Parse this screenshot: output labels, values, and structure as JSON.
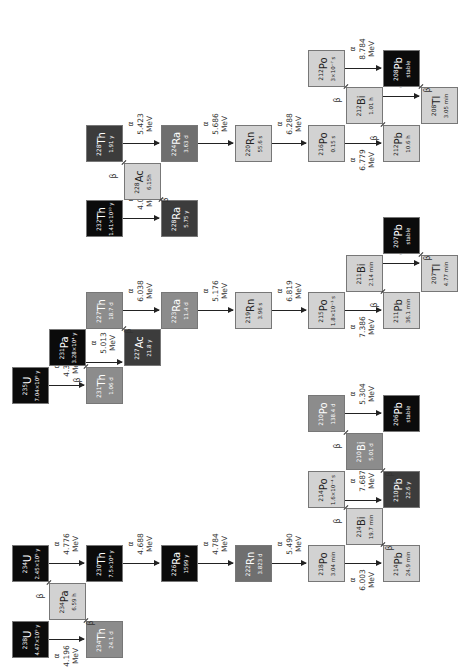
{
  "colors": {
    "black": "#0b0b0b",
    "dark": "#3c3c3c",
    "mid": "#6f6f6f",
    "midlight": "#8c8c8c",
    "light": "#d2d2d2",
    "line": "#222222"
  },
  "labels": {
    "alpha": "α",
    "beta": "β",
    "mev": "MeV"
  },
  "nuclides": [
    {
      "id": "th232",
      "mass": "232",
      "el": "Th",
      "hl": "1.41×10¹⁰ y",
      "x": 86,
      "y": 200,
      "shade": "black"
    },
    {
      "id": "ra228",
      "mass": "228",
      "el": "Ra",
      "hl": "5.75 y",
      "x": 161,
      "y": 200,
      "shade": "dark"
    },
    {
      "id": "ac228",
      "mass": "228",
      "el": "Ac",
      "hl": "6.15h",
      "x": 124,
      "y": 163,
      "shade": "light"
    },
    {
      "id": "th228",
      "mass": "228",
      "el": "Th",
      "hl": "1.91 y",
      "x": 86,
      "y": 125,
      "shade": "dark"
    },
    {
      "id": "ra224",
      "mass": "224",
      "el": "Ra",
      "hl": "3.63 d",
      "x": 161,
      "y": 125,
      "shade": "mid"
    },
    {
      "id": "rn220",
      "mass": "220",
      "el": "Rn",
      "hl": "55.6 s",
      "x": 235,
      "y": 125,
      "shade": "light"
    },
    {
      "id": "po216",
      "mass": "216",
      "el": "Po",
      "hl": "0.15 s",
      "x": 308,
      "y": 125,
      "shade": "light"
    },
    {
      "id": "pb212",
      "mass": "212",
      "el": "Pb",
      "hl": "10.6 h",
      "x": 383,
      "y": 125,
      "shade": "light"
    },
    {
      "id": "bi212",
      "mass": "212",
      "el": "Bi",
      "hl": "1.01 h",
      "x": 346,
      "y": 87,
      "shade": "light"
    },
    {
      "id": "po212",
      "mass": "212",
      "el": "Po",
      "hl": "3×10⁻⁷ s",
      "x": 308,
      "y": 50,
      "shade": "light"
    },
    {
      "id": "pb208",
      "mass": "208",
      "el": "Pb",
      "hl": "stable",
      "x": 383,
      "y": 50,
      "shade": "black"
    },
    {
      "id": "tl208",
      "mass": "208",
      "el": "Tl",
      "hl": "3.05 min",
      "x": 421,
      "y": 87,
      "shade": "light"
    },
    {
      "id": "u235",
      "mass": "235",
      "el": "U",
      "hl": "7.04×10⁸ y",
      "x": 12,
      "y": 367,
      "shade": "black"
    },
    {
      "id": "th231",
      "mass": "231",
      "el": "Th",
      "hl": "1.06 d",
      "x": 86,
      "y": 367,
      "shade": "midlight"
    },
    {
      "id": "pa231",
      "mass": "231",
      "el": "Pa",
      "hl": "3.28×10⁴ y",
      "x": 49,
      "y": 329,
      "shade": "black"
    },
    {
      "id": "ac227",
      "mass": "227",
      "el": "Ac",
      "hl": "21.8 y",
      "x": 124,
      "y": 329,
      "shade": "dark"
    },
    {
      "id": "th227",
      "mass": "227",
      "el": "Th",
      "hl": "18.7 d",
      "x": 86,
      "y": 292,
      "shade": "midlight"
    },
    {
      "id": "ra223",
      "mass": "223",
      "el": "Ra",
      "hl": "11.4 d",
      "x": 161,
      "y": 292,
      "shade": "midlight"
    },
    {
      "id": "rn219",
      "mass": "219",
      "el": "Rn",
      "hl": "3.96 s",
      "x": 235,
      "y": 292,
      "shade": "light"
    },
    {
      "id": "po215",
      "mass": "215",
      "el": "Po",
      "hl": "1.8×10⁻³ s",
      "x": 308,
      "y": 292,
      "shade": "light"
    },
    {
      "id": "pb211",
      "mass": "211",
      "el": "Pb",
      "hl": "36.1 min",
      "x": 383,
      "y": 292,
      "shade": "light"
    },
    {
      "id": "bi211",
      "mass": "211",
      "el": "Bi",
      "hl": "2.14 min",
      "x": 346,
      "y": 255,
      "shade": "light"
    },
    {
      "id": "tl207",
      "mass": "207",
      "el": "Tl",
      "hl": "4.77 min",
      "x": 421,
      "y": 255,
      "shade": "light"
    },
    {
      "id": "pb207",
      "mass": "207",
      "el": "Pb",
      "hl": "stable",
      "x": 383,
      "y": 217,
      "shade": "black"
    },
    {
      "id": "po210",
      "mass": "210",
      "el": "Po",
      "hl": "138.4 d",
      "x": 308,
      "y": 395,
      "shade": "midlight"
    },
    {
      "id": "pb206",
      "mass": "206",
      "el": "Pb",
      "hl": "stable",
      "x": 383,
      "y": 395,
      "shade": "black"
    },
    {
      "id": "bi210",
      "mass": "210",
      "el": "Bi",
      "hl": "5.01 d",
      "x": 346,
      "y": 433,
      "shade": "midlight"
    },
    {
      "id": "po214",
      "mass": "214",
      "el": "Po",
      "hl": "1.6×10⁻⁴ s",
      "x": 308,
      "y": 471,
      "shade": "light"
    },
    {
      "id": "pb210",
      "mass": "210",
      "el": "Pb",
      "hl": "22.6 y",
      "x": 383,
      "y": 471,
      "shade": "dark"
    },
    {
      "id": "bi214",
      "mass": "214",
      "el": "Bi",
      "hl": "19.7 min",
      "x": 346,
      "y": 508,
      "shade": "light"
    },
    {
      "id": "u234",
      "mass": "234",
      "el": "U",
      "hl": "2.45×10⁵ y",
      "x": 12,
      "y": 545,
      "shade": "black"
    },
    {
      "id": "th230",
      "mass": "230",
      "el": "Th",
      "hl": "7.5×10⁴ y",
      "x": 86,
      "y": 545,
      "shade": "black"
    },
    {
      "id": "ra226",
      "mass": "226",
      "el": "Ra",
      "hl": "1599 y",
      "x": 161,
      "y": 545,
      "shade": "black"
    },
    {
      "id": "rn222",
      "mass": "222",
      "el": "Rn",
      "hl": "3.823 d",
      "x": 235,
      "y": 545,
      "shade": "mid"
    },
    {
      "id": "po218",
      "mass": "218",
      "el": "Po",
      "hl": "3.04 min",
      "x": 308,
      "y": 545,
      "shade": "light"
    },
    {
      "id": "pb214",
      "mass": "214",
      "el": "Pb",
      "hl": "24.9 min",
      "x": 383,
      "y": 545,
      "shade": "light"
    },
    {
      "id": "pa234",
      "mass": "234",
      "el": "Pa",
      "hl": "6.59 h",
      "x": 49,
      "y": 583,
      "shade": "light"
    },
    {
      "id": "u238",
      "mass": "238",
      "el": "U",
      "hl": "4.47×10⁹ y",
      "x": 12,
      "y": 621,
      "shade": "black"
    },
    {
      "id": "th234",
      "mass": "234",
      "el": "Th",
      "hl": "24.1 d",
      "x": 86,
      "y": 621,
      "shade": "midlight"
    }
  ],
  "alpha_decays": [
    {
      "from": "th232",
      "to": "ra228",
      "energy": "4.010",
      "x1": 123,
      "x2": 161,
      "y": 218
    },
    {
      "from": "th228",
      "to": "ra224",
      "energy": "5.423",
      "x1": 123,
      "x2": 161,
      "y": 143
    },
    {
      "from": "ra224",
      "to": "rn220",
      "energy": "5.686",
      "x1": 198,
      "x2": 235,
      "y": 143
    },
    {
      "from": "rn220",
      "to": "po216",
      "energy": "6.288",
      "x1": 272,
      "x2": 308,
      "y": 143
    },
    {
      "from": "po216",
      "to": "pb212",
      "energy": "6.779",
      "x1": 345,
      "x2": 383,
      "y": 143,
      "below": true
    },
    {
      "from": "po212",
      "to": "pb208",
      "energy": "8.784",
      "x1": 345,
      "x2": 383,
      "y": 68
    },
    {
      "from": "bi212",
      "to": "tl208",
      "energy": "6.051",
      "x1": 383,
      "x2": 421,
      "y": 96
    },
    {
      "from": "u235",
      "to": "th231",
      "energy": "4.395",
      "x1": 49,
      "x2": 86,
      "y": 385
    },
    {
      "from": "pa231",
      "to": "ac227",
      "energy": "5.013",
      "x1": 86,
      "x2": 124,
      "y": 362
    },
    {
      "from": "th227",
      "to": "ra223",
      "energy": "6.038",
      "x1": 123,
      "x2": 161,
      "y": 310
    },
    {
      "from": "ra223",
      "to": "rn219",
      "energy": "5.176",
      "x1": 198,
      "x2": 235,
      "y": 310
    },
    {
      "from": "rn219",
      "to": "po215",
      "energy": "6.819",
      "x1": 272,
      "x2": 308,
      "y": 310
    },
    {
      "from": "po215",
      "to": "pb211",
      "energy": "7.386",
      "x1": 345,
      "x2": 383,
      "y": 310,
      "below": true
    },
    {
      "from": "bi211",
      "to": "tl207",
      "energy": "6.623",
      "x1": 383,
      "x2": 421,
      "y": 263
    },
    {
      "from": "po210",
      "to": "pb206",
      "energy": "5.304",
      "x1": 345,
      "x2": 383,
      "y": 413
    },
    {
      "from": "po214",
      "to": "pb210",
      "energy": "7.687",
      "x1": 345,
      "x2": 383,
      "y": 500
    },
    {
      "from": "u234",
      "to": "th230",
      "energy": "4.776",
      "x1": 49,
      "x2": 86,
      "y": 563
    },
    {
      "from": "th230",
      "to": "ra226",
      "energy": "4.688",
      "x1": 123,
      "x2": 161,
      "y": 563
    },
    {
      "from": "ra226",
      "to": "rn222",
      "energy": "4.784",
      "x1": 198,
      "x2": 235,
      "y": 563
    },
    {
      "from": "rn222",
      "to": "po218",
      "energy": "5.490",
      "x1": 272,
      "x2": 308,
      "y": 563
    },
    {
      "from": "po218",
      "to": "pb214",
      "energy": "6.003",
      "x1": 345,
      "x2": 383,
      "y": 563,
      "below": true
    },
    {
      "from": "u238",
      "to": "th234",
      "energy": "4.196",
      "x1": 49,
      "x2": 86,
      "y": 639,
      "below": true
    }
  ],
  "beta_decays": [
    {
      "from": "ra228",
      "to": "ac228",
      "x": 161,
      "y": 200,
      "lx": 163,
      "ly": 196
    },
    {
      "from": "ac228",
      "to": "th228",
      "x": 124,
      "y": 163,
      "lx": 111,
      "ly": 172
    },
    {
      "from": "pb212",
      "to": "bi212",
      "x": 383,
      "y": 125,
      "lx": 372,
      "ly": 134
    },
    {
      "from": "bi212",
      "to": "po212",
      "x": 346,
      "y": 87,
      "lx": 335,
      "ly": 96
    },
    {
      "from": "tl208",
      "to": "pb208",
      "x": 421,
      "y": 87,
      "lx": 425,
      "ly": 86
    },
    {
      "from": "th231",
      "to": "pa231",
      "x": 86,
      "y": 367,
      "lx": 75,
      "ly": 376
    },
    {
      "from": "ac227",
      "to": "th227",
      "x": 124,
      "y": 329,
      "lx": 126,
      "ly": 327
    },
    {
      "from": "pb211",
      "to": "bi211",
      "x": 383,
      "y": 292,
      "lx": 372,
      "ly": 301
    },
    {
      "from": "tl207",
      "to": "pb207",
      "x": 421,
      "y": 255,
      "lx": 425,
      "ly": 254
    },
    {
      "from": "bi210",
      "to": "po210",
      "x": 346,
      "y": 433,
      "lx": 335,
      "ly": 442
    },
    {
      "from": "pb210",
      "to": "bi210",
      "x": 383,
      "y": 471,
      "lx": 387,
      "ly": 470
    },
    {
      "from": "bi214",
      "to": "po214",
      "x": 346,
      "y": 508,
      "lx": 335,
      "ly": 517
    },
    {
      "from": "pb214",
      "to": "bi214",
      "x": 383,
      "y": 545,
      "lx": 387,
      "ly": 544
    },
    {
      "from": "pa234",
      "to": "u234",
      "x": 49,
      "y": 583,
      "lx": 38,
      "ly": 592
    },
    {
      "from": "th234",
      "to": "pa234",
      "x": 86,
      "y": 621,
      "lx": 88,
      "ly": 619
    }
  ]
}
